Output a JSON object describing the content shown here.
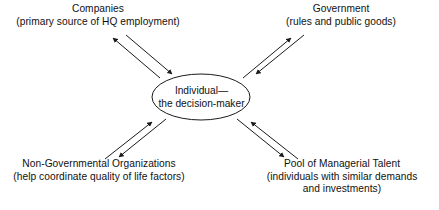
{
  "diagram": {
    "background_color": "#ffffff",
    "line_color": "#1a1a1a",
    "text_color": "#111111",
    "center": {
      "shape": "ellipse",
      "line1": "Individual—",
      "line2": "the decision-maker"
    },
    "nodes": {
      "companies": {
        "title": "Companies",
        "detail": "(primary source of HQ employment)"
      },
      "government": {
        "title": "Government",
        "detail": "(rules and public goods)"
      },
      "ngo": {
        "title": "Non-Governmental Organizations",
        "detail": "(help coordinate quality of life factors)"
      },
      "talent": {
        "title": "Pool of Managerial Talent",
        "detail_line1": "(individuals with similar demands",
        "detail_line2": "and investments)"
      }
    },
    "connectors": [
      {
        "name": "companies-individual",
        "from": "Companies",
        "to": "Individual—the decision-maker",
        "direction": "bidirectional"
      },
      {
        "name": "government-individual",
        "from": "Government",
        "to": "Individual—the decision-maker",
        "direction": "bidirectional"
      },
      {
        "name": "ngo-individual",
        "from": "Non-Governmental Organizations",
        "to": "Individual—the decision-maker",
        "direction": "bidirectional"
      },
      {
        "name": "talent-individual",
        "from": "Pool of Managerial Talent",
        "to": "Individual—the decision-maker",
        "direction": "bidirectional"
      }
    ]
  }
}
